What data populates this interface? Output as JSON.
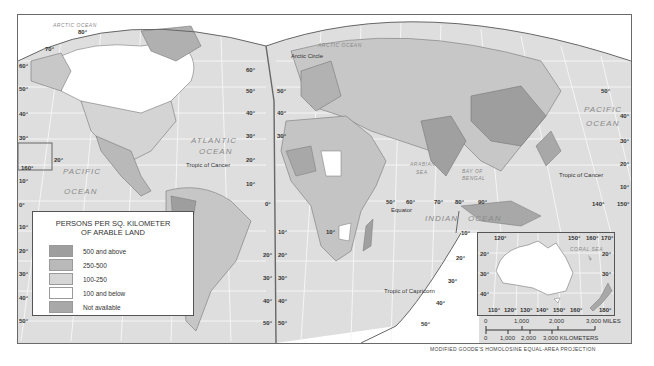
{
  "legend": {
    "title_line1": "PERSONS PER SQ. KILOMETER",
    "title_line2": "OF ARABLE LAND",
    "items": [
      {
        "label": "500 and above",
        "color": "#9e9e9e"
      },
      {
        "label": "250-500",
        "color": "#b9b9b9"
      },
      {
        "label": "100-250",
        "color": "#d6d6d6"
      },
      {
        "label": "100 and below",
        "color": "#ffffff"
      },
      {
        "label": "Not available",
        "color": "#a8a8a8"
      }
    ]
  },
  "colors": {
    "ocean": "#dedede",
    "grid": "#f4f4f4",
    "border": "#555555"
  },
  "oceans": {
    "arctic_left": "ARCTIC OCEAN",
    "arctic_right": "ARCTIC OCEAN",
    "atlantic_1": "ATLANTIC",
    "atlantic_2": "OCEAN",
    "pacific_left_1": "PACIFIC",
    "pacific_left_2": "OCEAN",
    "pacific_right_1": "PACIFIC",
    "pacific_right_2": "OCEAN",
    "indian_1": "INDIAN",
    "indian_2": "OCEAN",
    "arabian_1": "ARABIAN",
    "arabian_2": "SEA",
    "bengal_1": "BAY OF",
    "bengal_2": "BENGAL",
    "coral": "CORAL SEA"
  },
  "lines": {
    "arctic_circle": "Arctic Circle",
    "tropic_cancer_left": "Tropic of Cancer",
    "tropic_cancer_right": "Tropic of Cancer",
    "tropic_capricorn": "Tropic of Capricorn",
    "equator": "Equator"
  },
  "latitudes": {
    "left_edge": [
      "60°",
      "50°",
      "40°",
      "30°",
      "10°",
      "0°",
      "10°",
      "20°",
      "30°",
      "40°",
      "50°"
    ],
    "top_left": [
      "80°",
      "70°"
    ],
    "hawaii": [
      "20°",
      "160°"
    ],
    "atlantic_left": [
      "60°",
      "50°",
      "40°",
      "30°",
      "20°",
      "10°"
    ],
    "atlantic_right": [
      "60°",
      "50°",
      "40°",
      "30°"
    ],
    "south_atlantic_left": [
      "20°",
      "30°",
      "40°",
      "50°"
    ],
    "south_atlantic_right": [
      "10°",
      "20°",
      "30°",
      "40°",
      "50°"
    ],
    "zero": "0°",
    "africa_10": "10°",
    "indian_longitudes": [
      "50°",
      "60°",
      "70°",
      "80°",
      "90°"
    ],
    "indian_10": "10°",
    "indian_south": [
      "20°",
      "30°",
      "40°",
      "50°"
    ],
    "pacific_right": [
      "50°",
      "40°",
      "30°",
      "20°",
      "10°"
    ],
    "pacific_longitudes": [
      "140°",
      "150°"
    ]
  },
  "inset": {
    "top_longitudes": [
      "120°",
      "150°",
      "160°",
      "170°"
    ],
    "left_lats": [
      "20°",
      "30°",
      "40°"
    ],
    "right_lats": [
      "20°",
      "30°"
    ],
    "bottom_longitudes": [
      "110°",
      "120°",
      "130°",
      "140°",
      "150°",
      "160°",
      "180°"
    ]
  },
  "scale": {
    "miles_ticks": [
      "0",
      "1,000",
      "2,000",
      "3,000 MILES"
    ],
    "km_ticks": [
      "0",
      "1,000",
      "2,000",
      "3,000 KILOMETERS"
    ]
  },
  "projection": "MODIFIED GOODE'S HOMOLOSINE EQUAL-AREA PROJECTION"
}
